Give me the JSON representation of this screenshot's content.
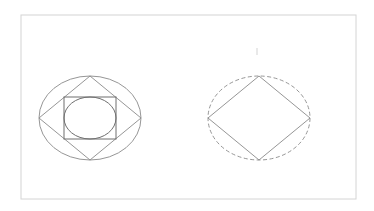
{
  "diagram": {
    "colors": {
      "background": "#ffffff",
      "frame": "#d4d4d4",
      "stroke": "#8a8a8a",
      "stroke_dark": "#6e6e6e",
      "tick": "#c8c8c8"
    },
    "frame": {
      "x": 21,
      "y": 15,
      "width": 335,
      "height": 184
    },
    "left_figure": {
      "outer_ellipse": {
        "cx": 90,
        "cy": 118,
        "rx": 51,
        "ry": 42
      },
      "diamond": {
        "top": [
          90,
          76
        ],
        "right": [
          141,
          118
        ],
        "bottom": [
          90,
          160
        ],
        "left": [
          39,
          118
        ]
      },
      "square": {
        "x": 64,
        "y": 97,
        "width": 52,
        "height": 42
      },
      "inner_ellipse": {
        "cx": 90,
        "cy": 118,
        "rx": 26,
        "ry": 21
      }
    },
    "right_figure": {
      "dashed_ellipse": {
        "cx": 259,
        "cy": 118,
        "rx": 51,
        "ry": 42
      },
      "diamond": {
        "top": [
          259,
          76
        ],
        "right": [
          310,
          118
        ],
        "bottom": [
          259,
          160
        ],
        "left": [
          208,
          118
        ]
      }
    },
    "tick_mark": {
      "x": 257,
      "y1": 48,
      "y2": 55
    }
  }
}
